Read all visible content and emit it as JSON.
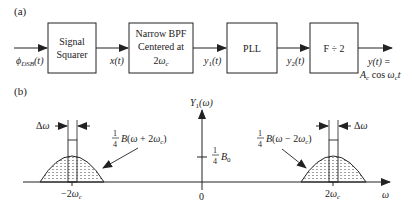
{
  "part_a": {
    "label": "(a)",
    "input_signal": "φDSB(t)",
    "blocks": [
      {
        "id": "signal-squarer",
        "lines": [
          "Signal",
          "Squarer"
        ]
      },
      {
        "id": "narrow-bpf",
        "lines": [
          "Narrow BPF",
          "Centered at",
          "2ωc"
        ]
      },
      {
        "id": "pll",
        "lines": [
          "PLL"
        ]
      },
      {
        "id": "freq-divider",
        "lines": [
          "F ÷ 2"
        ]
      }
    ],
    "signals": [
      "x(t)",
      "y1(t)",
      "y2(t)"
    ],
    "output_signal": [
      "y(t) =",
      "Ac cos ωct"
    ]
  },
  "part_b": {
    "label": "(b)",
    "y_axis_label": "Y1(ω)",
    "x_axis_label": "ω",
    "origin_label": "0",
    "dc_level_label": "1/4 B0",
    "left_center_label": "−2ωc",
    "right_center_label": "2ωc",
    "left_bump_label": "1/4 B(ω + 2ωc)",
    "right_bump_label": "1/4 B(ω − 2ωc)",
    "bandwidth_label": "Δω"
  }
}
